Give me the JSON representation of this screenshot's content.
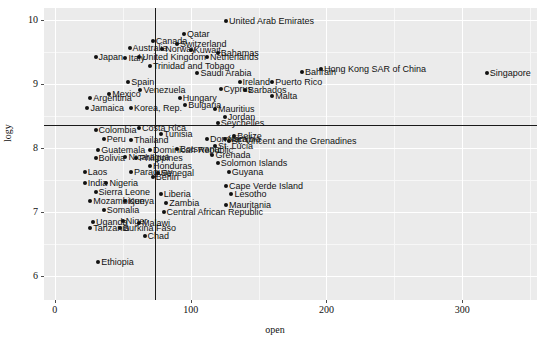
{
  "axes": {
    "x_title": "open",
    "y_title": "logy",
    "x_ticks": [
      0,
      100,
      200,
      300
    ],
    "y_ticks": [
      6,
      7,
      8,
      9,
      10
    ],
    "x_tick_labels": [
      "0",
      "100",
      "200",
      "300"
    ],
    "y_tick_labels": [
      "6",
      "7",
      "8",
      "9",
      "10"
    ]
  },
  "reference_lines": {
    "vertical_x": 74,
    "horizontal_y": 8.35
  },
  "colors": {
    "panel": "#ebebeb",
    "grid_major": "#ffffff",
    "grid_minor": "#f7f7f7",
    "point": "#111111",
    "reference_line": "#1a1a1a",
    "text": "#111111"
  },
  "chart_data": {
    "type": "scatter",
    "title": "",
    "xlabel": "open",
    "ylabel": "logy",
    "xlim": [
      -8,
      355
    ],
    "ylim": [
      5.62,
      10.18
    ],
    "grid": true,
    "legend": "none",
    "annotations": [
      {
        "label": "vertical reference line",
        "x": 74
      },
      {
        "label": "horizontal reference line",
        "y": 8.35
      }
    ],
    "points": [
      {
        "label": "United Arab Emirates",
        "open": 126,
        "logy": 9.98
      },
      {
        "label": "Qatar",
        "open": 95,
        "logy": 9.78
      },
      {
        "label": "Canada",
        "open": 72,
        "logy": 9.66
      },
      {
        "label": "Switzerland",
        "open": 90,
        "logy": 9.62
      },
      {
        "label": "Australia",
        "open": 55,
        "logy": 9.56
      },
      {
        "label": "Norway",
        "open": 79,
        "logy": 9.54
      },
      {
        "label": "Kuwait",
        "open": 100,
        "logy": 9.52
      },
      {
        "label": "Bahamas",
        "open": 120,
        "logy": 9.48
      },
      {
        "label": "Japan",
        "open": 30,
        "logy": 9.42
      },
      {
        "label": "Italy",
        "open": 52,
        "logy": 9.4
      },
      {
        "label": "United Kingdom",
        "open": 62,
        "logy": 9.41
      },
      {
        "label": "Netherlands",
        "open": 112,
        "logy": 9.42
      },
      {
        "label": "Trinidad and Tobago",
        "open": 70,
        "logy": 9.28
      },
      {
        "label": "Saudi Arabia",
        "open": 105,
        "logy": 9.16
      },
      {
        "label": "Spain",
        "open": 54,
        "logy": 9.02
      },
      {
        "label": "Ireland",
        "open": 136,
        "logy": 9.02
      },
      {
        "label": "Puerto Rico",
        "open": 160,
        "logy": 9.02
      },
      {
        "label": "Cyprus",
        "open": 122,
        "logy": 8.92
      },
      {
        "label": "Barbados",
        "open": 140,
        "logy": 8.9
      },
      {
        "label": "Venezuela",
        "open": 63,
        "logy": 8.9
      },
      {
        "label": "Mexico",
        "open": 40,
        "logy": 8.84
      },
      {
        "label": "Malta",
        "open": 160,
        "logy": 8.8
      },
      {
        "label": "Argentina",
        "open": 26,
        "logy": 8.78
      },
      {
        "label": "Hungary",
        "open": 92,
        "logy": 8.78
      },
      {
        "label": "Bulgaria",
        "open": 96,
        "logy": 8.66
      },
      {
        "label": "Jamaica",
        "open": 24,
        "logy": 8.62
      },
      {
        "label": "Korea, Rep.",
        "open": 56,
        "logy": 8.62
      },
      {
        "label": "Mauritius",
        "open": 118,
        "logy": 8.6
      },
      {
        "label": "Jordan",
        "open": 125,
        "logy": 8.48
      },
      {
        "label": "Seychelles",
        "open": 120,
        "logy": 8.38
      },
      {
        "label": "Colombia",
        "open": 30,
        "logy": 8.28
      },
      {
        "label": "Costa Rica",
        "open": 62,
        "logy": 8.3
      },
      {
        "label": "Tunisia",
        "open": 78,
        "logy": 8.22
      },
      {
        "label": "Peru",
        "open": 36,
        "logy": 8.14
      },
      {
        "label": "Thailand",
        "open": 56,
        "logy": 8.12
      },
      {
        "label": "Dominica",
        "open": 112,
        "logy": 8.14
      },
      {
        "label": "Namibia",
        "open": 125,
        "logy": 8.14
      },
      {
        "label": "Belize",
        "open": 132,
        "logy": 8.18
      },
      {
        "label": "St. Vincent and the Grenadines",
        "open": 128,
        "logy": 8.1
      },
      {
        "label": "Guatemala",
        "open": 32,
        "logy": 7.96
      },
      {
        "label": "Botswana",
        "open": 90,
        "logy": 7.98
      },
      {
        "label": "Dominican Republic",
        "open": 70,
        "logy": 7.96
      },
      {
        "label": "St. Lucia",
        "open": 118,
        "logy": 8.02
      },
      {
        "label": "Bolivia",
        "open": 30,
        "logy": 7.84
      },
      {
        "label": "Nicaragua",
        "open": 52,
        "logy": 7.86
      },
      {
        "label": "Philippines",
        "open": 60,
        "logy": 7.84
      },
      {
        "label": "Grenada",
        "open": 116,
        "logy": 7.88
      },
      {
        "label": "Solomon Islands",
        "open": 120,
        "logy": 7.76
      },
      {
        "label": "Honduras",
        "open": 70,
        "logy": 7.72
      },
      {
        "label": "Laos",
        "open": 22,
        "logy": 7.62
      },
      {
        "label": "Paraguay",
        "open": 56,
        "logy": 7.62
      },
      {
        "label": "Senegal",
        "open": 76,
        "logy": 7.6
      },
      {
        "label": "Guyana",
        "open": 128,
        "logy": 7.62
      },
      {
        "label": "Benin",
        "open": 72,
        "logy": 7.54
      },
      {
        "label": "India",
        "open": 22,
        "logy": 7.44
      },
      {
        "label": "Nigeria",
        "open": 38,
        "logy": 7.44
      },
      {
        "label": "Cape Verde Island",
        "open": 126,
        "logy": 7.4
      },
      {
        "label": "Sierra Leone",
        "open": 30,
        "logy": 7.3
      },
      {
        "label": "Liberia",
        "open": 78,
        "logy": 7.28
      },
      {
        "label": "Lesotho",
        "open": 130,
        "logy": 7.28
      },
      {
        "label": "Mozambique",
        "open": 26,
        "logy": 7.16
      },
      {
        "label": "Kenya",
        "open": 52,
        "logy": 7.16
      },
      {
        "label": "Zambia",
        "open": 82,
        "logy": 7.14
      },
      {
        "label": "Mauritania",
        "open": 126,
        "logy": 7.1
      },
      {
        "label": "Somalia",
        "open": 36,
        "logy": 7.02
      },
      {
        "label": "Central African Republic",
        "open": 80,
        "logy": 7.0
      },
      {
        "label": "Uganda",
        "open": 28,
        "logy": 6.84
      },
      {
        "label": "Niger",
        "open": 50,
        "logy": 6.86
      },
      {
        "label": "Malawi",
        "open": 62,
        "logy": 6.82
      },
      {
        "label": "Tanzania",
        "open": 26,
        "logy": 6.74
      },
      {
        "label": "Burkina Faso",
        "open": 48,
        "logy": 6.74
      },
      {
        "label": "Chad",
        "open": 66,
        "logy": 6.62
      },
      {
        "label": "Ethiopia",
        "open": 32,
        "logy": 6.22
      },
      {
        "label": "Bahrain",
        "open": 182,
        "logy": 9.18
      },
      {
        "label": "Hong Kong SAR of China",
        "open": 196,
        "logy": 9.22
      },
      {
        "label": "Singapore",
        "open": 318,
        "logy": 9.16
      }
    ]
  }
}
